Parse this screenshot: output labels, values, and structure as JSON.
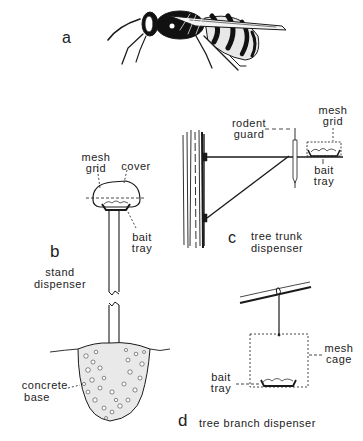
{
  "figure": {
    "panels": {
      "a": {
        "letter": "a",
        "subject": "wasp"
      },
      "b": {
        "letter": "b",
        "title_line1": "stand",
        "title_line2": "dispenser",
        "labels": {
          "mesh_grid_1": "mesh",
          "mesh_grid_2": "grid",
          "cover": "cover",
          "bait_tray_1": "bait",
          "bait_tray_2": "tray",
          "concrete_base_1": "concrete",
          "concrete_base_2": "base"
        }
      },
      "c": {
        "letter": "c",
        "title_line1": "tree trunk",
        "title_line2": "dispenser",
        "labels": {
          "rodent_guard_1": "rodent",
          "rodent_guard_2": "guard",
          "mesh_grid_1": "mesh",
          "mesh_grid_2": "grid",
          "bait_tray_1": "bait",
          "bait_tray_2": "tray"
        }
      },
      "d": {
        "letter": "d",
        "title": "tree branch dispenser",
        "labels": {
          "mesh_cage_1": "mesh",
          "mesh_cage_2": "cage",
          "bait_tray_1": "bait",
          "bait_tray_2": "tray"
        }
      }
    },
    "colors": {
      "ink": "#1a1a1a",
      "background": "#ffffff"
    }
  }
}
